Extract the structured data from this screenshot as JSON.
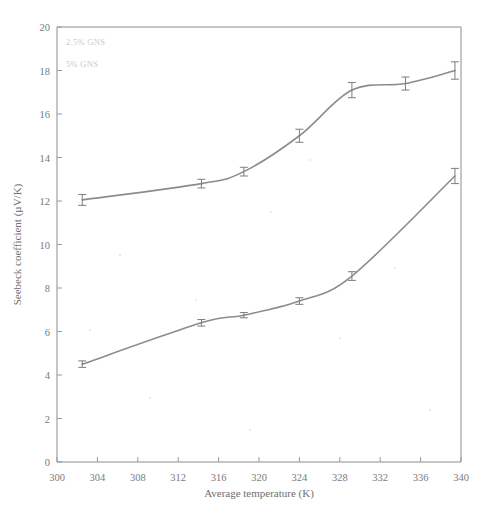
{
  "chart_data": {
    "type": "line",
    "title": "",
    "xlabel": "Average temperature (K)",
    "ylabel": "Seebeck coefficient (µV/K)",
    "xlim": [
      300,
      340
    ],
    "ylim": [
      0,
      20
    ],
    "xticks": [
      300,
      304,
      308,
      312,
      316,
      320,
      324,
      328,
      332,
      336,
      340
    ],
    "yticks": [
      0,
      2,
      4,
      6,
      8,
      10,
      12,
      14,
      16,
      18,
      20
    ],
    "grid": false,
    "legend_position": "top-left",
    "series": [
      {
        "name": "2.5% GNS",
        "color": "#8c8c8c",
        "x": [
          302.5,
          314.3,
          318.5,
          324.0,
          329.2,
          334.5,
          339.4
        ],
        "values": [
          12.05,
          12.8,
          13.35,
          15.0,
          17.1,
          17.4,
          18.0
        ],
        "errors": [
          0.25,
          0.2,
          0.2,
          0.3,
          0.35,
          0.3,
          0.4
        ]
      },
      {
        "name": "5% GNS",
        "color": "#8c8c8c",
        "x": [
          302.5,
          314.3,
          318.5,
          324.0,
          329.2,
          339.4
        ],
        "values": [
          4.5,
          6.4,
          6.75,
          7.4,
          8.55,
          13.15
        ],
        "errors": [
          0.15,
          0.15,
          0.12,
          0.15,
          0.2,
          0.35
        ]
      }
    ]
  },
  "legend": {
    "entries": [
      {
        "label": "2.5% GNS"
      },
      {
        "label": "5% GNS"
      }
    ]
  },
  "axes": {
    "x_title": "Average temperature (K)",
    "y_title": "Seebeck coefficient (µV/K)",
    "x_tick_labels": [
      "300",
      "304",
      "308",
      "312",
      "316",
      "320",
      "324",
      "328",
      "332",
      "336",
      "340"
    ],
    "y_tick_labels": [
      "0",
      "2",
      "4",
      "6",
      "8",
      "10",
      "12",
      "14",
      "16",
      "18",
      "20"
    ]
  }
}
